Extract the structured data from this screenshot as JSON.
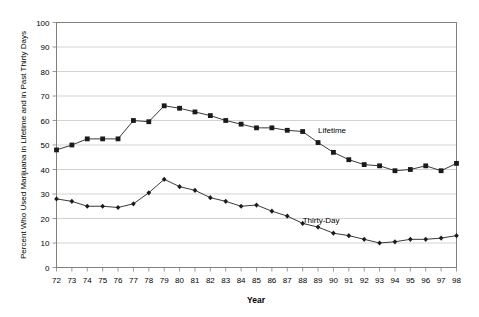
{
  "chart_data": {
    "type": "line",
    "title": "",
    "xlabel": "Year",
    "ylabel": "Percent Who Used Marijuana in Lifetime and in Past Thirty Days",
    "xlim": [
      1972,
      1998
    ],
    "ylim": [
      0,
      100
    ],
    "ytick_step": 10,
    "grid": true,
    "legend_position": "inline-annotation",
    "x": [
      1972,
      1973,
      1974,
      1975,
      1976,
      1977,
      1978,
      1979,
      1980,
      1981,
      1982,
      1983,
      1984,
      1985,
      1986,
      1987,
      1988,
      1989,
      1990,
      1991,
      1992,
      1993,
      1994,
      1995,
      1996,
      1997,
      1998
    ],
    "xtick_labels": [
      "72",
      "73",
      "74",
      "75",
      "76",
      "77",
      "78",
      "79",
      "80",
      "81",
      "82",
      "83",
      "84",
      "85",
      "86",
      "87",
      "88",
      "89",
      "90",
      "91",
      "92",
      "93",
      "94",
      "95",
      "96",
      "97",
      "98"
    ],
    "ytick_labels": [
      "0",
      "10",
      "20",
      "30",
      "40",
      "50",
      "60",
      "70",
      "80",
      "90",
      "100"
    ],
    "ytick_values": [
      0,
      10,
      20,
      30,
      40,
      50,
      60,
      70,
      80,
      90,
      100
    ],
    "series": [
      {
        "name": "Lifetime",
        "label": "Lifetime",
        "color": "#3a3a3a",
        "marker": "square",
        "label_x": 1989,
        "label_y": 55,
        "values": [
          48,
          50,
          52.5,
          52.5,
          52.5,
          60,
          59.5,
          66,
          65,
          63.5,
          62,
          60,
          58.5,
          57,
          57,
          56,
          55.5,
          51,
          47,
          44,
          42,
          41.5,
          39.5,
          40,
          41.5,
          39.5,
          42.5
        ]
      },
      {
        "name": "Thirty-Day",
        "label": "Thirty-Day",
        "color": "#3a3a3a",
        "marker": "diamond",
        "label_x": 1988,
        "label_y": 18,
        "values": [
          28,
          27,
          25,
          25,
          24.5,
          26,
          30.5,
          36,
          33,
          31.5,
          28.5,
          27,
          25,
          25.5,
          23,
          21,
          18,
          16.5,
          14,
          13,
          11.5,
          10,
          10.5,
          11.5,
          11.5,
          12,
          13
        ]
      }
    ]
  }
}
